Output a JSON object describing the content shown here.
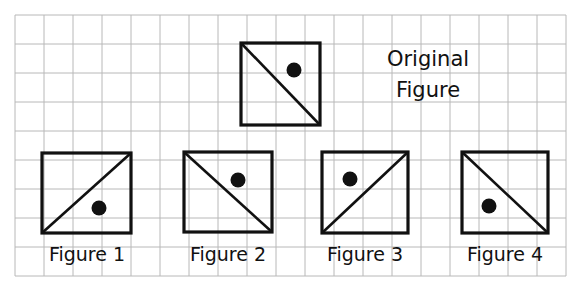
{
  "canvas": {
    "width": 583,
    "height": 294,
    "background": "#ffffff"
  },
  "grid": {
    "name": "graph-paper-grid",
    "line_color": "#b8b8b8",
    "line_width": 1,
    "cell_size": 29,
    "origin_x": 15,
    "origin_y": 15,
    "cols": 19,
    "rows": 9
  },
  "style": {
    "shape_stroke": "#111111",
    "shape_stroke_width": 3.2,
    "diagonal_stroke_width": 2.6,
    "dot_fill": "#111111",
    "dot_radius": 7.5,
    "shape_fill": "none"
  },
  "title": {
    "name": "original-figure-caption",
    "lines": [
      "Original",
      "Figure"
    ],
    "line1": "Original",
    "line2": "Figure",
    "center_x": 428,
    "line1_y": 47,
    "line2_y": 78,
    "font_size": 21
  },
  "original": {
    "label": "Original Figure",
    "square": {
      "x": 241,
      "y": 43,
      "width": 79,
      "height": 82
    },
    "diagonal": "top-left-to-bottom-right",
    "dot": {
      "cx": 294,
      "cy": 70
    }
  },
  "figures": [
    {
      "label": "Figure 1",
      "square": {
        "x": 42,
        "y": 153,
        "width": 89,
        "height": 80
      },
      "diagonal": "bottom-left-to-top-right",
      "dot": {
        "cx": 99,
        "cy": 208
      },
      "label_center_x": 87,
      "label_y": 243
    },
    {
      "label": "Figure 2",
      "square": {
        "x": 184,
        "y": 152,
        "width": 88,
        "height": 80
      },
      "diagonal": "top-left-to-bottom-right",
      "dot": {
        "cx": 238,
        "cy": 180
      },
      "label_center_x": 228,
      "label_y": 243
    },
    {
      "label": "Figure 3",
      "square": {
        "x": 322,
        "y": 152,
        "width": 86,
        "height": 81
      },
      "diagonal": "bottom-left-to-top-right",
      "dot": {
        "cx": 350,
        "cy": 179
      },
      "label_center_x": 365,
      "label_y": 243
    },
    {
      "label": "Figure 4",
      "square": {
        "x": 462,
        "y": 152,
        "width": 86,
        "height": 81
      },
      "diagonal": "top-left-to-bottom-right",
      "dot": {
        "cx": 489,
        "cy": 206
      },
      "label_center_x": 505,
      "label_y": 243
    }
  ]
}
